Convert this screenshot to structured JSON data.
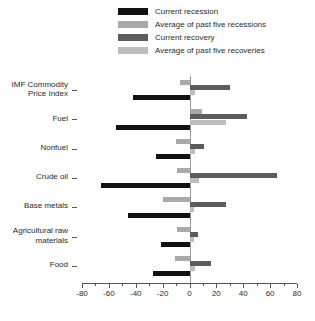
{
  "legend": {
    "position": "top",
    "items": [
      {
        "label": "Current recession",
        "color": "#111111",
        "swatch_name": "legend-swatch-current-recession"
      },
      {
        "label": "Average of past five recessions",
        "color": "#a9a9a9",
        "swatch_name": "legend-swatch-avg-past-recessions"
      },
      {
        "label": "Current recovery",
        "color": "#5c5c5c",
        "swatch_name": "legend-swatch-current-recovery"
      },
      {
        "label": "Average of past five recoveries",
        "color": "#bdbdbd",
        "swatch_name": "legend-swatch-avg-past-recoveries"
      }
    ]
  },
  "axis": {
    "x_ticks": [
      "-80",
      "-60",
      "-40",
      "-20",
      "0",
      "20",
      "40",
      "60",
      "80"
    ],
    "x_min": -80,
    "x_max": 80
  },
  "chart_data": {
    "type": "bar",
    "orientation": "horizontal",
    "title": "",
    "subtitle": "",
    "xlabel": "",
    "ylabel": "",
    "xlim": [
      -80,
      80
    ],
    "xticks": [
      -80,
      -60,
      -40,
      -20,
      0,
      20,
      40,
      60,
      80
    ],
    "grid": false,
    "legend_position": "top",
    "categories": [
      "IMF Commodity\nPrice Index",
      "Fuel",
      "Nonfuel",
      "Crude oil",
      "Base metals",
      "Agricultural raw\nmaterials",
      "Food"
    ],
    "series": [
      {
        "name": "Current recession",
        "color": "#111111",
        "values": [
          -42,
          -55,
          -25,
          -66,
          -46,
          -21,
          -27
        ]
      },
      {
        "name": "Average of past five recessions",
        "color": "#a9a9a9",
        "values": [
          -7,
          9,
          -10,
          -9,
          -20,
          -9,
          -11
        ]
      },
      {
        "name": "Current recovery",
        "color": "#5c5c5c",
        "values": [
          30,
          43,
          11,
          65,
          27,
          6,
          16
        ]
      },
      {
        "name": "Average of past five recoveries",
        "color": "#bdbdbd",
        "values": [
          4,
          27,
          4,
          7,
          3,
          3,
          4
        ]
      }
    ]
  }
}
